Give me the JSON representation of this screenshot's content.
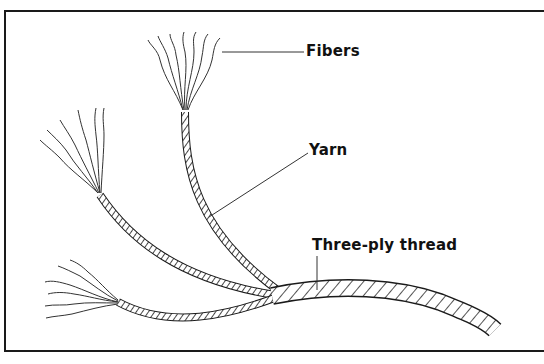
{
  "diagram": {
    "labels": {
      "fibers": "Fibers",
      "yarn": "Yarn",
      "thread": "Three-ply thread"
    },
    "colors": {
      "ink": "#1a1a1a",
      "background": "#ffffff"
    }
  }
}
